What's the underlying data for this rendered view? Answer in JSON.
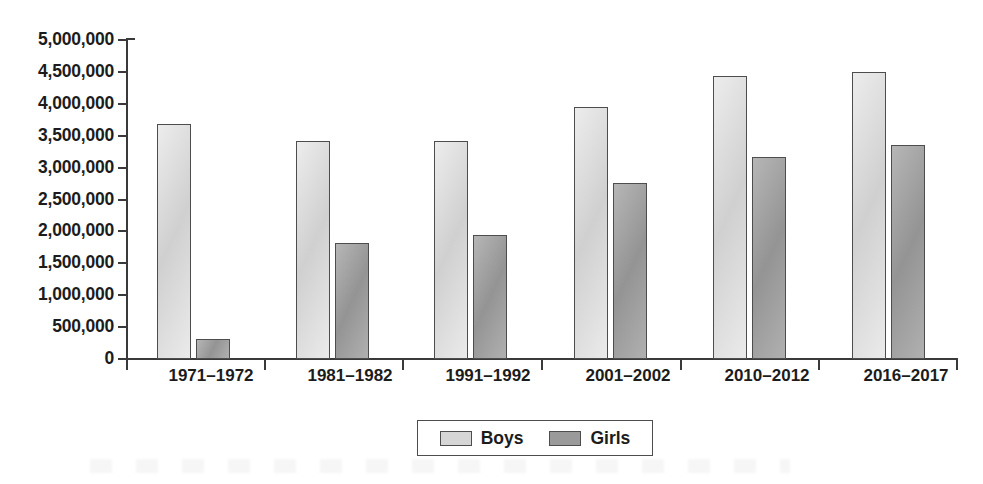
{
  "chart_data": {
    "type": "bar",
    "title": "",
    "subtitle": "",
    "xlabel": "",
    "ylabel": "",
    "categories": [
      "1971–1972",
      "1981–1982",
      "1991–1992",
      "2001–2002",
      "2010–2012",
      "2016–2017"
    ],
    "series": [
      {
        "name": "Boys",
        "color": "#d6d6d6",
        "values": [
          3680000,
          3420000,
          3420000,
          3950000,
          4440000,
          4500000
        ]
      },
      {
        "name": "Girls",
        "color": "#9a9a9a",
        "values": [
          310000,
          1820000,
          1940000,
          2760000,
          3170000,
          3350000
        ]
      }
    ],
    "ylim": [
      0,
      5000000
    ],
    "ytick_step": 500000,
    "ytick_labels": [
      "5,000,000",
      "4,500,000",
      "4,000,000",
      "3,500,000",
      "3,000,000",
      "2,500,000",
      "2,000,000",
      "1,500,000",
      "1,000,000",
      "500,000",
      "0"
    ],
    "ytick_values": [
      5000000,
      4500000,
      4000000,
      3500000,
      3000000,
      2500000,
      2000000,
      1500000,
      1000000,
      500000,
      0
    ],
    "grid": false,
    "legend": {
      "position": "bottom",
      "entries": [
        "Boys",
        "Girls"
      ]
    }
  },
  "axis": {
    "line_color": "#3a3a3a",
    "bar_border_color": "#4d4d4d"
  },
  "legend": {
    "entries": [
      {
        "label": "Boys",
        "swatch": "boys-swatch"
      },
      {
        "label": "Girls",
        "swatch": "girls-swatch"
      }
    ]
  }
}
